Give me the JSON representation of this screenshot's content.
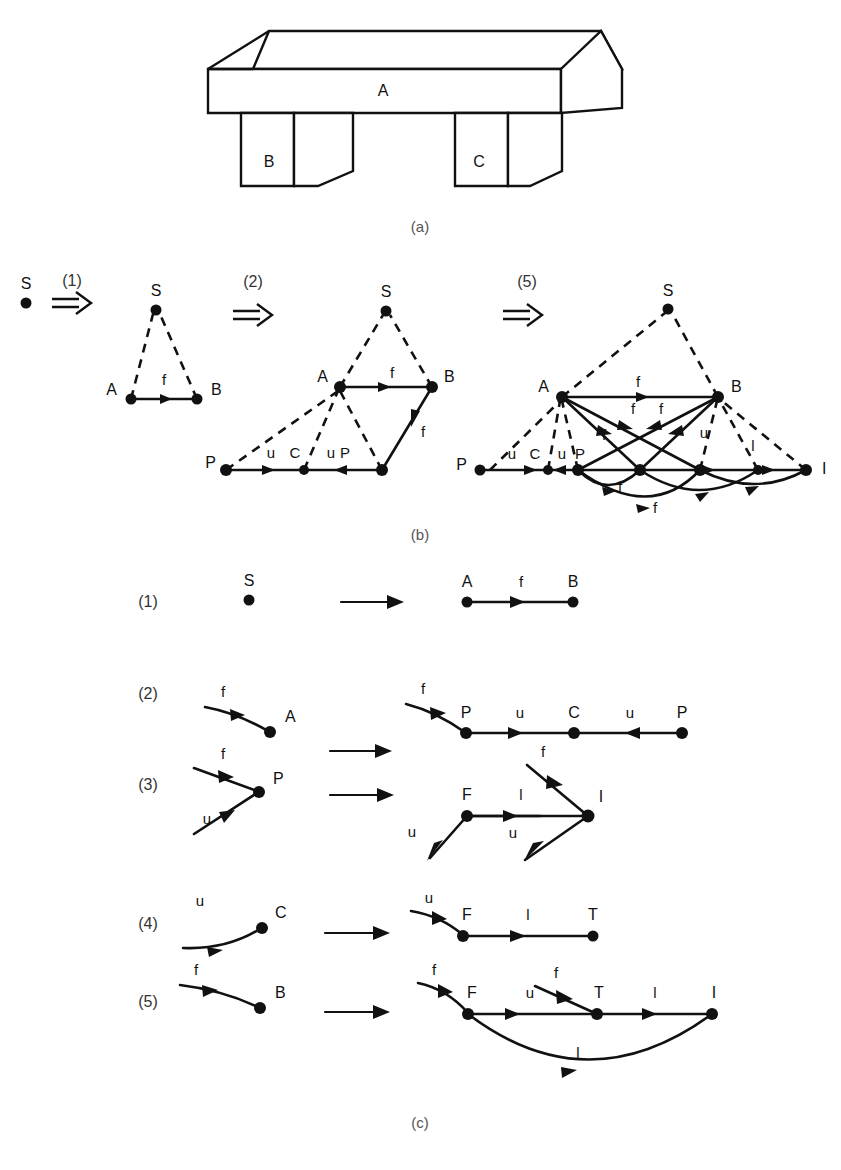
{
  "figure": {
    "panels": [
      {
        "id": "a",
        "caption": "(a)",
        "description": "line drawing of a table-like object with a top slab and two legs"
      },
      {
        "id": "b",
        "caption": "(b)",
        "description": "derivation sequence of graphs produced by applying rules"
      },
      {
        "id": "c",
        "caption": "(c)",
        "description": "the five graph rewriting rules"
      }
    ]
  },
  "panel_a": {
    "caption": "(a)",
    "part_labels": [
      {
        "name": "top-slab-label",
        "text": "A"
      },
      {
        "name": "left-leg-label",
        "text": "B"
      },
      {
        "name": "right-leg-label",
        "text": "C"
      }
    ]
  },
  "panel_b": {
    "caption": "(b)",
    "steps": [
      {
        "name": "step-1",
        "text": "(1)"
      },
      {
        "name": "step-2",
        "text": "(2)"
      },
      {
        "name": "step-5",
        "text": "(5)"
      }
    ],
    "graph_0": {
      "nodes": [
        {
          "id": "S",
          "label": "S"
        }
      ],
      "edges": []
    },
    "graph_1": {
      "nodes": [
        {
          "id": "S",
          "label": "S"
        },
        {
          "id": "A",
          "label": "A"
        },
        {
          "id": "B",
          "label": "B"
        }
      ],
      "edges": [
        {
          "from": "S",
          "to": "A",
          "label": "",
          "style": "dashed"
        },
        {
          "from": "S",
          "to": "B",
          "label": "",
          "style": "dashed"
        },
        {
          "from": "A",
          "to": "B",
          "label": "f",
          "style": "solid"
        }
      ]
    },
    "graph_2": {
      "nodes": [
        {
          "id": "S",
          "label": "S"
        },
        {
          "id": "A",
          "label": "A"
        },
        {
          "id": "B",
          "label": "B"
        },
        {
          "id": "P1",
          "label": "P"
        },
        {
          "id": "C",
          "label": "C"
        },
        {
          "id": "P2",
          "label": "P"
        }
      ],
      "edges": [
        {
          "from": "S",
          "to": "A",
          "label": "",
          "style": "dashed"
        },
        {
          "from": "S",
          "to": "B",
          "label": "",
          "style": "dashed"
        },
        {
          "from": "A",
          "to": "B",
          "label": "f",
          "style": "solid"
        },
        {
          "from": "A",
          "to": "P1",
          "label": "",
          "style": "dashed"
        },
        {
          "from": "A",
          "to": "C",
          "label": "",
          "style": "dashed"
        },
        {
          "from": "A",
          "to": "P2",
          "label": "",
          "style": "dashed"
        },
        {
          "from": "P1",
          "to": "C",
          "label": "u",
          "style": "solid"
        },
        {
          "from": "P2",
          "to": "C",
          "label": "u",
          "style": "solid"
        },
        {
          "from": "B",
          "to": "P2",
          "label": "f",
          "style": "solid"
        }
      ],
      "edge_labels_bottom": [
        "u",
        "C",
        "u",
        "P"
      ]
    },
    "graph_3": {
      "nodes": [
        {
          "id": "S",
          "label": "S"
        },
        {
          "id": "A",
          "label": "A"
        },
        {
          "id": "B",
          "label": "B"
        },
        {
          "id": "F1",
          "label": ""
        },
        {
          "id": "C",
          "label": "C"
        },
        {
          "id": "P",
          "label": "P"
        },
        {
          "id": "T",
          "label": ""
        },
        {
          "id": "L",
          "label": ""
        },
        {
          "id": "I",
          "label": "I"
        }
      ],
      "edge_labels": [
        "f",
        "f",
        "f",
        "f",
        "f",
        "f",
        "u",
        "u",
        "u",
        "l",
        "l"
      ],
      "bottom_labels": [
        "u",
        "C",
        "u",
        "P"
      ],
      "right_label": "I"
    }
  },
  "panel_c": {
    "caption": "(c)",
    "rules": [
      {
        "number": "(1)",
        "lhs": {
          "nodes": [
            {
              "label": "S"
            }
          ],
          "edges": []
        },
        "rhs": {
          "nodes": [
            {
              "label": "A"
            },
            {
              "label": "B"
            }
          ],
          "edges": [
            {
              "label": "f"
            }
          ]
        }
      },
      {
        "number": "(2)",
        "lhs": {
          "nodes": [
            {
              "label": "A"
            }
          ],
          "edges": [
            {
              "label": "f"
            }
          ]
        },
        "rhs": {
          "nodes": [
            {
              "label": "P"
            },
            {
              "label": "C"
            },
            {
              "label": "P"
            }
          ],
          "edges": [
            {
              "label": "f"
            },
            {
              "label": "u"
            },
            {
              "label": "u"
            }
          ]
        }
      },
      {
        "number": "(3)",
        "lhs": {
          "nodes": [
            {
              "label": "P"
            }
          ],
          "edges": [
            {
              "label": "f"
            },
            {
              "label": "u"
            }
          ]
        },
        "rhs": {
          "nodes": [
            {
              "label": "F"
            },
            {
              "label": "I"
            }
          ],
          "edges": [
            {
              "label": "u"
            },
            {
              "label": "l"
            },
            {
              "label": "f"
            },
            {
              "label": "u"
            }
          ]
        }
      },
      {
        "number": "(4)",
        "lhs": {
          "nodes": [
            {
              "label": "C"
            }
          ],
          "edges": [
            {
              "label": "u"
            }
          ]
        },
        "rhs": {
          "nodes": [
            {
              "label": "F"
            },
            {
              "label": "T"
            }
          ],
          "edges": [
            {
              "label": "u"
            },
            {
              "label": "l"
            }
          ]
        }
      },
      {
        "number": "(5)",
        "lhs": {
          "nodes": [
            {
              "label": "B"
            }
          ],
          "edges": [
            {
              "label": "f"
            }
          ]
        },
        "rhs": {
          "nodes": [
            {
              "label": "F"
            },
            {
              "label": "T"
            },
            {
              "label": "I"
            }
          ],
          "edges": [
            {
              "label": "f"
            },
            {
              "label": "u"
            },
            {
              "label": "f"
            },
            {
              "label": "l"
            },
            {
              "label": "l"
            }
          ]
        }
      }
    ]
  },
  "colors": {
    "ink": "#111111",
    "background": "#ffffff",
    "caption": "#555555"
  }
}
